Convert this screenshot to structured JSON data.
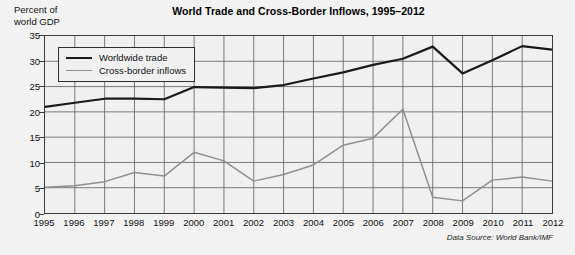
{
  "figure": {
    "width": 575,
    "height": 255,
    "background_color": "#f2f2f2",
    "plot_background_color": "#f0f0f0",
    "frame_color": "#3a3a3a"
  },
  "y_axis_caption": "Percent of\nworld GDP",
  "source_note": "Data Source: World Bank/IMF",
  "legend": {
    "position": "top-left-inside",
    "entries": [
      {
        "label": "Worldwide trade",
        "color": "#1a1a1a",
        "width": 2.2
      },
      {
        "label": "Cross-border inflows",
        "color": "#8f8f8f",
        "width": 1.6
      }
    ]
  },
  "chart_data": {
    "type": "line",
    "title": "World Trade and Cross-Border Inflows, 1995–2012",
    "xlabel": "",
    "ylabel": "Percent of world GDP",
    "grid": true,
    "legend_position": "top-left-inside",
    "xlim": [
      1995,
      2012
    ],
    "ylim": [
      0,
      35
    ],
    "yticks": [
      0,
      5,
      10,
      15,
      20,
      25,
      30,
      35
    ],
    "categories": [
      "1995",
      "1996",
      "1997",
      "1998",
      "1999",
      "2000",
      "2001",
      "2002",
      "2003",
      "2004",
      "2005",
      "2006",
      "2007",
      "2008",
      "2009",
      "2010",
      "2011",
      "2012"
    ],
    "x": [
      1995,
      1996,
      1997,
      1998,
      1999,
      2000,
      2001,
      2002,
      2003,
      2004,
      2005,
      2006,
      2007,
      2008,
      2009,
      2010,
      2011,
      2012
    ],
    "series": [
      {
        "name": "Worldwide trade",
        "color": "#1a1a1a",
        "values": [
          21.0,
          21.8,
          22.6,
          22.6,
          22.5,
          24.9,
          24.8,
          24.7,
          25.3,
          26.6,
          27.8,
          29.3,
          30.5,
          32.9,
          27.6,
          30.2,
          33.0,
          32.3
        ]
      },
      {
        "name": "Cross-border inflows",
        "color": "#8f8f8f",
        "values": [
          5.1,
          5.4,
          6.2,
          8.0,
          7.3,
          12.0,
          10.3,
          6.3,
          7.6,
          9.5,
          13.4,
          14.8,
          20.5,
          3.1,
          2.4,
          6.5,
          7.1,
          6.3
        ]
      }
    ]
  }
}
